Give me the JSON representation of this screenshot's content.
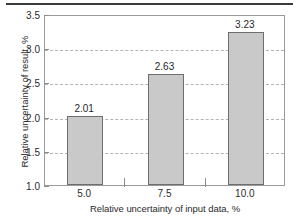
{
  "chart_data": {
    "type": "bar",
    "title": "",
    "xlabel": "Relative uncertainty of input data, %",
    "ylabel": "Relative uncertainty of result, %",
    "categories": [
      "5.0",
      "7.5",
      "10.0"
    ],
    "values": [
      2.01,
      2.63,
      3.23
    ],
    "data_labels": [
      "2.01",
      "2.63",
      "3.23"
    ],
    "ylim": [
      1.0,
      3.5
    ],
    "ytick_labels": [
      "1.0",
      "1.5",
      "2.0",
      "2.5",
      "3.0",
      "3.5"
    ],
    "ytick_values": [
      1.0,
      1.5,
      2.0,
      2.5,
      3.0,
      3.5
    ],
    "grid": "horizontal-dashed",
    "legend": "none",
    "bar_fill_color": "#c9c9c9",
    "bar_border_color": "#6e6e6e",
    "grid_color": "#b4b4b4",
    "axis_color": "#9a9a9a",
    "background_color": "#ffffff"
  },
  "figure": {
    "rule_color": "#3a3a3a"
  }
}
